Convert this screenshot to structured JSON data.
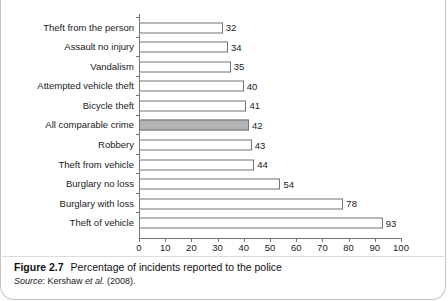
{
  "figure": {
    "number_label": "Figure 2.7",
    "title": "Percentage of incidents reported to the police",
    "source_label": "Source",
    "source_separator": ": ",
    "source_author": "Kershaw ",
    "source_etal": "et al.",
    "source_year": " (2008)."
  },
  "colors": {
    "bar_fill": "#ffffff",
    "bar_stroke": "#6f7479",
    "highlight_fill": "#b4b4b4",
    "axis": "#6f7479",
    "text": "#1a1a1a",
    "card_border": "#bfc3c6"
  },
  "chart_data": {
    "type": "bar",
    "orientation": "horizontal",
    "title": "Percentage of incidents reported to the police",
    "xlabel": "",
    "ylabel": "",
    "xlim": [
      0,
      100
    ],
    "xticks": [
      0,
      10,
      20,
      30,
      40,
      50,
      60,
      70,
      80,
      90,
      100
    ],
    "xtick_labels": [
      "0",
      "10",
      "20",
      "30",
      "40",
      "50",
      "60",
      "70",
      "80",
      "90",
      "100"
    ],
    "grid": false,
    "legend": false,
    "data_labels": true,
    "highlight_category": "All comparable crime",
    "categories": [
      "Theft from the person",
      "Assault no injury",
      "Vandalism",
      "Attempted vehicle theft",
      "Bicycle theft",
      "All comparable crime",
      "Robbery",
      "Theft from vehicle",
      "Burglary no loss",
      "Burglary with loss",
      "Theft of vehicle"
    ],
    "values": [
      32,
      34,
      35,
      40,
      41,
      42,
      43,
      44,
      54,
      78,
      93
    ],
    "value_labels": [
      "32",
      "34",
      "35",
      "40",
      "41",
      "42",
      "43",
      "44",
      "54",
      "78",
      "93"
    ]
  }
}
